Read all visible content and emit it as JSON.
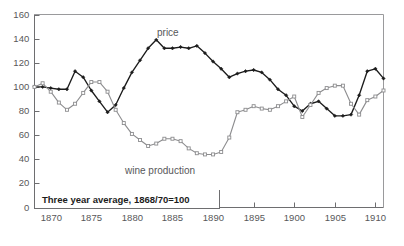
{
  "chart_data": {
    "type": "line",
    "title": "",
    "subtitle": "",
    "xlabel": "",
    "ylabel": "",
    "xlim": [
      1868,
      1911
    ],
    "ylim": [
      0,
      160
    ],
    "grid": false,
    "legend_position": "inline-annotations",
    "annotations": [
      {
        "text": "price",
        "x": 1884,
        "y": 150
      },
      {
        "text": "wine production",
        "x": 1884,
        "y": 32
      },
      {
        "text": "Three year average, 1868/70=100",
        "x": 1869,
        "y": 10
      }
    ],
    "xticks": [
      1870,
      1875,
      1880,
      1885,
      1890,
      1895,
      1900,
      1905,
      1910
    ],
    "xtick_labels": [
      "1870",
      "1875",
      "1880",
      "1885",
      "1890",
      "1895",
      "1900",
      "1905",
      "1910"
    ],
    "yticks": [
      0,
      20,
      40,
      60,
      80,
      100,
      120,
      140,
      160
    ],
    "ytick_labels": [
      "0",
      "20",
      "40",
      "60",
      "80",
      "100",
      "120",
      "140",
      "160"
    ],
    "series": [
      {
        "name": "price",
        "color": "#1c1c1c",
        "marker": "diamond",
        "x": [
          1868,
          1869,
          1870,
          1871,
          1872,
          1873,
          1874,
          1875,
          1876,
          1877,
          1878,
          1879,
          1880,
          1881,
          1882,
          1883,
          1884,
          1885,
          1886,
          1887,
          1888,
          1889,
          1890,
          1891,
          1892,
          1893,
          1894,
          1895,
          1896,
          1897,
          1898,
          1899,
          1900,
          1901,
          1902,
          1903,
          1904,
          1905,
          1906,
          1907,
          1908,
          1909,
          1910,
          1911
        ],
        "values": [
          100,
          100,
          99,
          98,
          98,
          113,
          108,
          97,
          88,
          79,
          85,
          99,
          112,
          122,
          132,
          139,
          132,
          132,
          133,
          132,
          134,
          128,
          121,
          115,
          108,
          111,
          113,
          114,
          112,
          106,
          98,
          93,
          84,
          80,
          86,
          88,
          82,
          76,
          76,
          77,
          93,
          113,
          115,
          107
        ]
      },
      {
        "name": "wine production",
        "color": "#8d8d8f",
        "marker": "square",
        "x": [
          1868,
          1869,
          1870,
          1871,
          1872,
          1873,
          1874,
          1875,
          1876,
          1877,
          1878,
          1879,
          1880,
          1881,
          1882,
          1883,
          1884,
          1885,
          1886,
          1887,
          1888,
          1889,
          1890,
          1891,
          1892,
          1893,
          1894,
          1895,
          1896,
          1897,
          1898,
          1899,
          1900,
          1901,
          1902,
          1903,
          1904,
          1905,
          1906,
          1907,
          1908,
          1909,
          1910,
          1911
        ],
        "values": [
          100,
          103,
          96,
          87,
          81,
          86,
          95,
          104,
          104,
          96,
          81,
          70,
          61,
          56,
          51,
          53,
          57,
          57,
          55,
          49,
          45,
          44,
          44,
          46,
          58,
          79,
          81,
          84,
          82,
          81,
          84,
          88,
          92,
          75,
          85,
          95,
          99,
          101,
          101,
          86,
          77,
          89,
          92,
          97
        ]
      }
    ]
  },
  "caption": {
    "text": "Three year average, 1868/70=100"
  },
  "labels": {
    "price": "price",
    "wine_production": "wine production"
  },
  "colors": {
    "price_line": "#1c1c1c",
    "wine_line": "#8d8d8f",
    "axis": "#6e6e70",
    "tick_text": "#58585a"
  }
}
